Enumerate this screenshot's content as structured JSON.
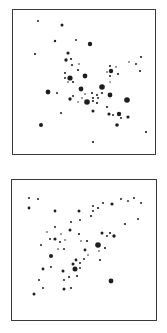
{
  "figure": {
    "panels": [
      {
        "id": "top",
        "box": {
          "x": 12,
          "y": 9,
          "w": 144,
          "h": 146
        },
        "dots": [
          [
            38,
            21,
            1.0
          ],
          [
            62,
            25,
            1.5
          ],
          [
            55,
            41,
            1.2
          ],
          [
            76,
            40,
            1.0
          ],
          [
            90,
            44,
            2.2
          ],
          [
            35,
            54,
            1.1
          ],
          [
            68,
            53,
            1.6
          ],
          [
            71,
            59,
            1.1
          ],
          [
            66,
            60,
            1.7
          ],
          [
            79,
            64,
            0.8
          ],
          [
            72,
            65,
            1.1
          ],
          [
            78,
            70,
            1.1
          ],
          [
            65,
            73,
            1.1
          ],
          [
            65,
            78,
            1.0
          ],
          [
            70,
            78,
            2.6
          ],
          [
            85,
            76,
            2.4
          ],
          [
            73,
            82,
            1.1
          ],
          [
            68,
            82,
            0.8
          ],
          [
            110,
            66,
            1.1
          ],
          [
            116,
            67,
            0.8
          ],
          [
            107,
            72,
            0.8
          ],
          [
            111,
            71,
            2.2
          ],
          [
            118,
            74,
            1.1
          ],
          [
            110,
            76,
            1.0
          ],
          [
            110,
            82,
            0.7
          ],
          [
            129,
            62,
            0.8
          ],
          [
            136,
            64,
            1.0
          ],
          [
            141,
            57,
            1.1
          ],
          [
            140,
            71,
            1.1
          ],
          [
            48,
            92,
            2.4
          ],
          [
            57,
            93,
            1.0
          ],
          [
            81,
            89,
            2.4
          ],
          [
            102,
            87,
            2.8
          ],
          [
            92,
            93,
            1.1
          ],
          [
            97,
            95,
            1.1
          ],
          [
            73,
            96,
            1.0
          ],
          [
            70,
            99,
            1.7
          ],
          [
            82,
            98,
            0.8
          ],
          [
            85,
            94,
            0.8
          ],
          [
            110,
            95,
            2.4
          ],
          [
            102,
            93,
            1.1
          ],
          [
            87,
            102,
            2.8
          ],
          [
            93,
            98,
            1.1
          ],
          [
            98,
            98,
            1.0
          ],
          [
            93,
            101,
            1.1
          ],
          [
            97,
            103,
            1.1
          ],
          [
            78,
            102,
            0.7
          ],
          [
            127,
            100,
            2.8
          ],
          [
            107,
            107,
            1.1
          ],
          [
            93,
            111,
            1.5
          ],
          [
            61,
            113,
            1.0
          ],
          [
            109,
            114,
            1.6
          ],
          [
            113,
            115,
            1.0
          ],
          [
            119,
            114,
            2.2
          ],
          [
            121,
            118,
            1.0
          ],
          [
            128,
            117,
            1.6
          ],
          [
            117,
            125,
            1.8
          ],
          [
            41,
            125,
            2.0
          ],
          [
            146,
            132,
            1.1
          ],
          [
            93,
            142,
            1.1
          ]
        ]
      },
      {
        "id": "bottom",
        "box": {
          "x": 11,
          "y": 179,
          "w": 146,
          "h": 142
        },
        "dots": [
          [
            29,
            198,
            1.0
          ],
          [
            38,
            199,
            1.0
          ],
          [
            29,
            208,
            1.4
          ],
          [
            55,
            211,
            1.4
          ],
          [
            79,
            211,
            1.5
          ],
          [
            93,
            206,
            1.0
          ],
          [
            98,
            208,
            1.1
          ],
          [
            93,
            211,
            1.0
          ],
          [
            103,
            203,
            1.0
          ],
          [
            112,
            204,
            1.6
          ],
          [
            121,
            199,
            1.0
          ],
          [
            128,
            201,
            0.9
          ],
          [
            134,
            198,
            1.0
          ],
          [
            141,
            203,
            1.0
          ],
          [
            138,
            219,
            1.0
          ],
          [
            125,
            224,
            1.1
          ],
          [
            91,
            216,
            1.1
          ],
          [
            80,
            220,
            1.0
          ],
          [
            71,
            222,
            1.0
          ],
          [
            55,
            227,
            1.0
          ],
          [
            70,
            230,
            1.5
          ],
          [
            79,
            234,
            1.1
          ],
          [
            61,
            234,
            0.8
          ],
          [
            47,
            232,
            0.8
          ],
          [
            55,
            239,
            1.6
          ],
          [
            50,
            239,
            1.0
          ],
          [
            60,
            242,
            1.0
          ],
          [
            65,
            240,
            0.8
          ],
          [
            41,
            245,
            1.0
          ],
          [
            81,
            241,
            0.8
          ],
          [
            87,
            241,
            1.1
          ],
          [
            102,
            233,
            1.5
          ],
          [
            110,
            233,
            1.1
          ],
          [
            107,
            236,
            1.0
          ],
          [
            114,
            236,
            1.7
          ],
          [
            98,
            245,
            2.8
          ],
          [
            64,
            249,
            1.0
          ],
          [
            58,
            249,
            0.8
          ],
          [
            105,
            248,
            1.1
          ],
          [
            99,
            251,
            0.8
          ],
          [
            51,
            256,
            2.0
          ],
          [
            85,
            250,
            1.4
          ],
          [
            88,
            255,
            0.8
          ],
          [
            84,
            259,
            1.0
          ],
          [
            76,
            260,
            1.4
          ],
          [
            80,
            263,
            1.0
          ],
          [
            73,
            264,
            1.5
          ],
          [
            100,
            260,
            1.1
          ],
          [
            43,
            269,
            1.4
          ],
          [
            51,
            267,
            1.0
          ],
          [
            63,
            271,
            1.5
          ],
          [
            75,
            269,
            2.5
          ],
          [
            80,
            268,
            1.0
          ],
          [
            69,
            277,
            1.1
          ],
          [
            77,
            276,
            1.1
          ],
          [
            39,
            280,
            1.0
          ],
          [
            64,
            280,
            1.0
          ],
          [
            111,
            281,
            2.4
          ],
          [
            43,
            288,
            1.0
          ],
          [
            64,
            289,
            1.5
          ],
          [
            71,
            288,
            1.1
          ],
          [
            34,
            294,
            1.5
          ]
        ]
      }
    ],
    "colors": {
      "dot": "#1e1e1e",
      "border": "#3a3a3a",
      "background": "#ffffff"
    }
  }
}
